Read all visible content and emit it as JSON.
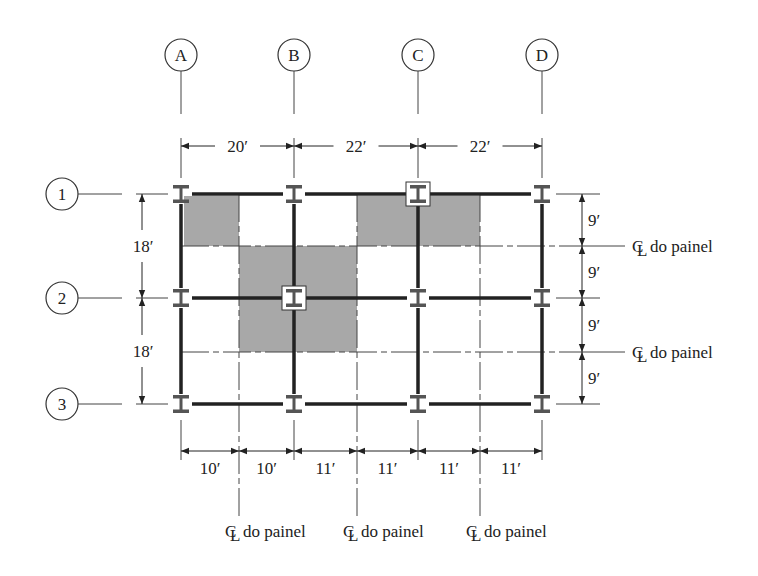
{
  "colors": {
    "line": "#222222",
    "thin_line": "#444444",
    "shade": "#a8a8a8",
    "column": "#555555",
    "background": "#ffffff"
  },
  "grid": {
    "columns": [
      {
        "label": "A",
        "x": 181
      },
      {
        "label": "B",
        "x": 294
      },
      {
        "label": "C",
        "x": 418
      },
      {
        "label": "D",
        "x": 542
      }
    ],
    "rows": [
      {
        "label": "1",
        "y": 194
      },
      {
        "label": "2",
        "y": 298
      },
      {
        "label": "3",
        "y": 404
      }
    ]
  },
  "top_dimensions": [
    {
      "text": "20′",
      "x1": 181,
      "x2": 294
    },
    {
      "text": "22′",
      "x1": 294,
      "x2": 418
    },
    {
      "text": "22′",
      "x1": 418,
      "x2": 542
    }
  ],
  "left_dimensions": [
    {
      "text": "18′",
      "y1": 194,
      "y2": 298
    },
    {
      "text": "18′",
      "y1": 298,
      "y2": 404
    }
  ],
  "right_dimensions": [
    {
      "text": "9′",
      "y1": 194,
      "y2": 246
    },
    {
      "text": "9′",
      "y1": 246,
      "y2": 298
    },
    {
      "text": "9′",
      "y1": 298,
      "y2": 352
    },
    {
      "text": "9′",
      "y1": 352,
      "y2": 404
    }
  ],
  "bottom_dimensions": [
    {
      "text": "10′",
      "x1": 181,
      "x2": 239
    },
    {
      "text": "10′",
      "x1": 239,
      "x2": 294
    },
    {
      "text": "11′",
      "x1": 294,
      "x2": 357
    },
    {
      "text": "11′",
      "x1": 357,
      "x2": 418
    },
    {
      "text": "11′",
      "x1": 418,
      "x2": 480
    },
    {
      "text": "11′",
      "x1": 480,
      "x2": 542
    }
  ],
  "panel_centerlines": {
    "horizontal": [
      {
        "y": 246,
        "label": "do painel",
        "symbol": "℄"
      },
      {
        "y": 352,
        "label": "do painel",
        "symbol": "℄"
      }
    ],
    "vertical": [
      {
        "x": 239,
        "label": "do painel",
        "symbol": "℄"
      },
      {
        "x": 357,
        "label": "do painel",
        "symbol": "℄"
      },
      {
        "x": 480,
        "label": "do painel",
        "symbol": "℄"
      }
    ]
  },
  "shaded_areas": [
    {
      "name": "tributary-area-beam-a1",
      "x": 184,
      "y": 196,
      "w": 55,
      "h": 50
    },
    {
      "name": "tributary-area-column-b2",
      "x": 239,
      "y": 246,
      "w": 118,
      "h": 106
    },
    {
      "name": "tributary-area-column-c1",
      "x": 357,
      "y": 196,
      "w": 123,
      "h": 50
    }
  ],
  "highlighted_columns": [
    "B2",
    "C1"
  ]
}
